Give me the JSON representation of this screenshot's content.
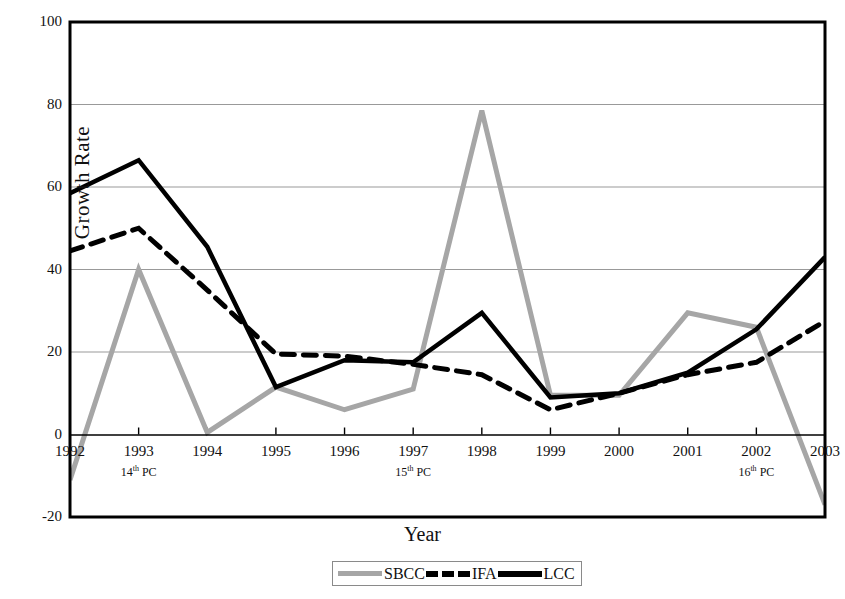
{
  "chart_data": {
    "type": "line",
    "title": "",
    "xlabel": "Year",
    "ylabel": "Growth Rate",
    "categories": [
      "1992",
      "1993",
      "1994",
      "1995",
      "1996",
      "1997",
      "1998",
      "1999",
      "2000",
      "2001",
      "2002",
      "2003"
    ],
    "x": [
      1992,
      1993,
      1994,
      1995,
      1996,
      1997,
      1998,
      1999,
      2000,
      2001,
      2002,
      2003
    ],
    "xlim": [
      1992,
      2003
    ],
    "ylim": [
      -20,
      100
    ],
    "yticks": [
      -20,
      0,
      20,
      40,
      60,
      80,
      100
    ],
    "grid": "horizontal",
    "legend_position": "bottom-center",
    "series": [
      {
        "name": "SBCC",
        "style": "solid",
        "color": "#a6a6a6",
        "values": [
          -11,
          40,
          0.5,
          11.5,
          6,
          11,
          78.5,
          9.5,
          9.5,
          29.5,
          26,
          -17
        ]
      },
      {
        "name": "IFA",
        "style": "dashed",
        "color": "#000000",
        "values": [
          44.5,
          50,
          35,
          19.5,
          19,
          17,
          14.5,
          6,
          10,
          14.5,
          17.5,
          27.5
        ]
      },
      {
        "name": "LCC",
        "style": "solid",
        "color": "#000000",
        "values": [
          58.5,
          66.5,
          45.5,
          11.5,
          18,
          17.5,
          29.5,
          9,
          10,
          15,
          25.5,
          43
        ]
      }
    ],
    "annotations": [
      {
        "x": "1993",
        "text": "14",
        "suffix": "th",
        "rest": " PC",
        "full": "14th PC"
      },
      {
        "x": "1997",
        "text": "15",
        "suffix": "th",
        "rest": " PC",
        "full": "15th PC"
      },
      {
        "x": "2002",
        "text": "16",
        "suffix": "th",
        "rest": " PC",
        "full": "16th PC"
      }
    ]
  },
  "axis": {
    "ylabel": "Growth Rate",
    "xlabel": "Year",
    "yticks": [
      "100",
      "80",
      "60",
      "40",
      "20",
      "0",
      "-20"
    ],
    "xticks": [
      "1992",
      "1993",
      "1994",
      "1995",
      "1996",
      "1997",
      "1998",
      "1999",
      "2000",
      "2001",
      "2002",
      "2003"
    ]
  },
  "annotations": {
    "a1_num": "14",
    "a1_sup": "th",
    "a1_rest": " PC",
    "a2_num": "15",
    "a2_sup": "th",
    "a2_rest": " PC",
    "a3_num": "16",
    "a3_sup": "th",
    "a3_rest": " PC"
  },
  "legend": {
    "items": [
      {
        "label": "SBCC",
        "style": "solid",
        "color": "#a6a6a6"
      },
      {
        "label": "IFA",
        "style": "dashed",
        "color": "#000000"
      },
      {
        "label": "LCC",
        "style": "solid",
        "color": "#000000"
      }
    ]
  },
  "colors": {
    "sbcc": "#a6a6a6",
    "ifa": "#000000",
    "lcc": "#000000",
    "grid": "#999999",
    "frame": "#000000"
  }
}
